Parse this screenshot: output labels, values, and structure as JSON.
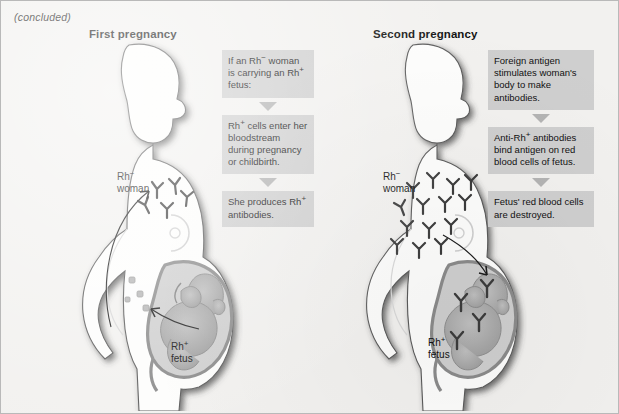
{
  "figure": {
    "continuation_note": "(concluded)",
    "background_color": "#f2f1ef",
    "border_color": "#b9b9b9"
  },
  "columns": [
    {
      "id": "first-pregnancy",
      "title": "First pregnancy",
      "labels": {
        "woman": {
          "prefix": "Rh",
          "sign": "−",
          "line2": "woman"
        },
        "fetus": {
          "prefix": "Rh",
          "sign": "+",
          "line2": "fetus"
        }
      },
      "steps": [
        "If an Rh− woman is carrying an Rh+ fetus:",
        "Rh+ cells enter her bloodstream during pregnancy or childbirth.",
        "She produces Rh+ antibodies."
      ],
      "steps_rich": [
        [
          {
            "t": "If an Rh"
          },
          {
            "sup": "−"
          },
          {
            "t": " woman is carrying an Rh"
          },
          {
            "sup": "+"
          },
          {
            "t": " fetus:"
          }
        ],
        [
          {
            "t": "Rh"
          },
          {
            "sup": "+"
          },
          {
            "t": " cells enter her bloodstream during pregnancy or childbirth."
          }
        ],
        [
          {
            "t": "She produces Rh"
          },
          {
            "sup": "+"
          },
          {
            "t": " antibodies."
          }
        ]
      ],
      "antibody_count": 5,
      "fetal_cell_count": 4
    },
    {
      "id": "second-pregnancy",
      "title": "Second pregnancy",
      "labels": {
        "woman": {
          "prefix": "Rh",
          "sign": "−",
          "line2": "woman"
        },
        "fetus": {
          "prefix": "Rh",
          "sign": "+",
          "line2": "fetus"
        }
      },
      "steps": [
        "Foreign antigen stimulates woman's body to make antibodies.",
        "Anti-Rh+ antibodies bind antigen on red blood cells of fetus.",
        "Fetus' red blood cells are destroyed."
      ],
      "steps_rich": [
        [
          {
            "t": "Foreign antigen stimulates woman's body to make antibodies."
          }
        ],
        [
          {
            "t": "Anti-Rh"
          },
          {
            "sup": "+"
          },
          {
            "t": " antibodies bind antigen on red blood cells of fetus."
          }
        ],
        [
          {
            "t": "Fetus' red blood cells are destroyed."
          }
        ]
      ],
      "antibody_count": 14,
      "antibodies_in_uterus": 4
    }
  ],
  "icons": {
    "flow_arrow": "down-triangle-arrow",
    "antibody": "y-shaped-antibody",
    "curved_arrow": "curved-arrow"
  },
  "colors": {
    "box_fill": "#cfcfcf",
    "arrow_fill": "#b4b4b4",
    "silhouette_fill": "#fdfdfc",
    "silhouette_shadow": "#4a4a4a",
    "uterus_stroke": "#8b8b8b",
    "fetus_fill": "#a9a9a9",
    "antibody": "#3c3c3c",
    "text": "#111111"
  }
}
